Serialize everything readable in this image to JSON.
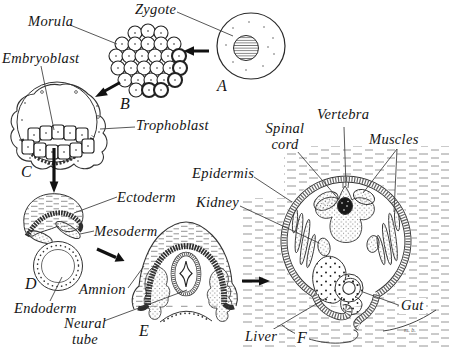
{
  "figure": {
    "labels": {
      "zygote": "Zygote",
      "morula": "Morula",
      "embryoblast": "Embryoblast",
      "trophoblast": "Trophoblast",
      "ectoderm": "Ectoderm",
      "mesoderm": "Mesoderm",
      "endoderm": "Endoderm",
      "amnion": "Amnion",
      "neural_tube": "Neural tube",
      "epidermis": "Epidermis",
      "kidney": "Kidney",
      "spinal_cord": "Spinal cord",
      "vertebra": "Vertebra",
      "muscles": "Muscles",
      "gut": "Gut",
      "liver": "Liver"
    },
    "stages": {
      "a": "A",
      "b": "B",
      "c": "C",
      "d": "D",
      "e": "E",
      "f": "F"
    },
    "signature": "m. b.",
    "colors": {
      "ink": "#222222",
      "paper": "#ffffff"
    }
  }
}
